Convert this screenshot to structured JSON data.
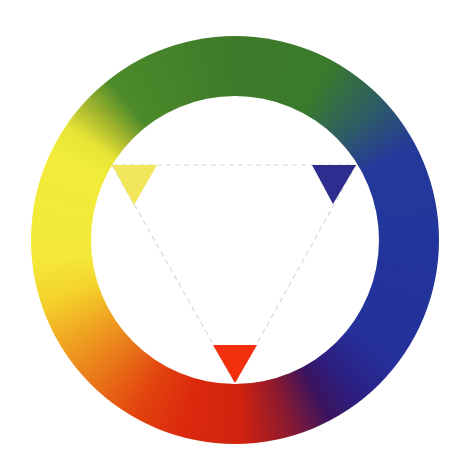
{
  "diagram": {
    "type": "color-wheel",
    "wheel": {
      "center": [
        235,
        240
      ],
      "outer_radius": 204,
      "inner_radius": 144,
      "segments": [
        {
          "name": "green",
          "color": "#3f7a2a"
        },
        {
          "name": "blue-green",
          "color": "#2f5f60"
        },
        {
          "name": "blue",
          "color": "#22349c"
        },
        {
          "name": "violet",
          "color": "#3a145f"
        },
        {
          "name": "red-violet",
          "color": "#8a1a30"
        },
        {
          "name": "red",
          "color": "#dc2a0e"
        },
        {
          "name": "red-orange",
          "color": "#e2440e"
        },
        {
          "name": "orange",
          "color": "#ea7a1a"
        },
        {
          "name": "yellow-orange",
          "color": "#f0a822"
        },
        {
          "name": "yellow",
          "color": "#f2ec3a"
        },
        {
          "name": "yellow-green",
          "color": "#a8b82e"
        }
      ]
    },
    "triad": {
      "line_color": "#d8d8d8",
      "line_style": "dashed",
      "markers": [
        {
          "name": "yellow-primary",
          "color": "#f2e65a",
          "points": "112,165 157,165 134,205"
        },
        {
          "name": "blue-primary",
          "color": "#2c2d8e",
          "points": "312,165 356,165 333,204"
        },
        {
          "name": "red-primary",
          "color": "#f2300e",
          "points": "213,345 257,345 235,383"
        }
      ],
      "outline_points": "112,165 356,165 235,383"
    }
  }
}
